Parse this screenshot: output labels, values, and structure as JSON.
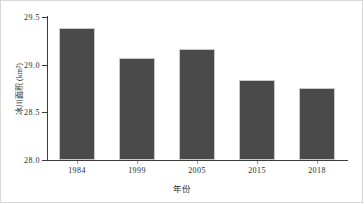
{
  "figure": {
    "background_color": "#ffffff",
    "frame_color": "#d8d8d8",
    "axis_color": "#3b3b3b"
  },
  "chart_data": {
    "type": "bar",
    "title": "",
    "subtitle": "",
    "xlabel": "年份",
    "ylabel": "冰川面积 (km²)",
    "categories": [
      "1984",
      "1999",
      "2005",
      "2015",
      "2018"
    ],
    "values": [
      29.39,
      29.07,
      29.16,
      28.84,
      28.76
    ],
    "series": [
      {
        "name": "冰川面积",
        "values": [
          29.39,
          29.07,
          29.16,
          28.84,
          28.76
        ],
        "color": "#4a4a4a"
      }
    ],
    "ylim": [
      28.0,
      29.5
    ],
    "yticks": [
      "28.0",
      "28.5",
      "29.0",
      "29.5"
    ],
    "ytick_values": [
      28.0,
      28.5,
      29.0,
      29.5
    ],
    "xticks": [
      "1984",
      "1999",
      "2005",
      "2015",
      "2018"
    ],
    "grid": false,
    "legend": null,
    "legend_position": "none",
    "bar_color": "#4a4a4a",
    "bar_edge_color": "#c9c9c9",
    "annotations": []
  }
}
